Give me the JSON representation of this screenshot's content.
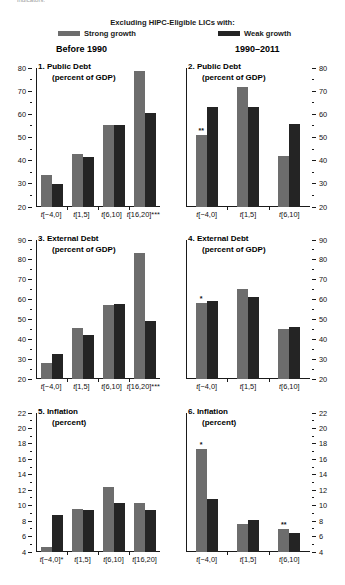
{
  "page": {
    "cut_text": "indicators."
  },
  "legend": {
    "title": "Excluding HIPC-Eligible LICs with:",
    "items": [
      {
        "label": "Strong growth",
        "color": "#6d6d6d",
        "swatch": "gray"
      },
      {
        "label": "Weak growth",
        "color": "#242424",
        "swatch": "dark"
      }
    ]
  },
  "columns": [
    {
      "label": "Before 1990"
    },
    {
      "label": "1990–2011"
    }
  ],
  "chart_data": [
    {
      "type": "bar",
      "panel": "1",
      "title": "1. Public Debt",
      "subtitle": "(percent of GDP)",
      "ylabel": "",
      "ylim": [
        20,
        80
      ],
      "yticks": [
        20,
        30,
        40,
        50,
        60,
        70,
        80
      ],
      "yticklabels": [
        "20",
        "30",
        "40",
        "50",
        "60",
        "70",
        "80"
      ],
      "axis_side": "left",
      "categories": [
        "t[−4,0]",
        "t[1,5]",
        "t[6,10]",
        "t[16,20]***"
      ],
      "series": [
        {
          "name": "Strong growth",
          "color": "#6d6d6d",
          "values": [
            34.0,
            43.0,
            55.5,
            78.5
          ]
        },
        {
          "name": "Weak growth",
          "color": "#242424",
          "values": [
            30.0,
            41.5,
            55.5,
            60.5
          ]
        }
      ],
      "annotations": []
    },
    {
      "type": "bar",
      "panel": "2",
      "title": "2. Public Debt",
      "subtitle": "(percent of GDP)",
      "ylabel": "",
      "ylim": [
        20,
        80
      ],
      "yticks": [
        20,
        30,
        40,
        50,
        60,
        70,
        80
      ],
      "yticklabels": [
        "20",
        "30",
        "40",
        "50",
        "60",
        "70",
        "80"
      ],
      "axis_side": "right",
      "categories": [
        "t[−4,0]",
        "t[1,5]",
        "t[6,10]"
      ],
      "series": [
        {
          "name": "Strong growth",
          "color": "#6d6d6d",
          "values": [
            51.0,
            72.0,
            42.0
          ]
        },
        {
          "name": "Weak growth",
          "color": "#242424",
          "values": [
            63.0,
            63.0,
            56.0
          ]
        }
      ],
      "annotations": [
        {
          "group": 0,
          "series": 0,
          "text": "**"
        }
      ]
    },
    {
      "type": "bar",
      "panel": "3",
      "title": "3. External Debt",
      "subtitle": "(percent of GDP)",
      "ylabel": "",
      "ylim": [
        20,
        90
      ],
      "yticks": [
        20,
        30,
        40,
        50,
        60,
        70,
        80,
        90
      ],
      "yticklabels": [
        "20",
        "30",
        "40",
        "50",
        "60",
        "70",
        "80",
        "90"
      ],
      "axis_side": "left",
      "categories": [
        "t[−4,0]",
        "t[1,5]",
        "t[6,10]",
        "t[16,20]***"
      ],
      "series": [
        {
          "name": "Strong growth",
          "color": "#6d6d6d",
          "values": [
            28.0,
            45.5,
            57.5,
            83.5
          ]
        },
        {
          "name": "Weak growth",
          "color": "#242424",
          "values": [
            32.5,
            42.0,
            58.0,
            49.0
          ]
        }
      ],
      "annotations": []
    },
    {
      "type": "bar",
      "panel": "4",
      "title": "4. External Debt",
      "subtitle": "(percent of GDP)",
      "ylabel": "",
      "ylim": [
        20,
        90
      ],
      "yticks": [
        20,
        30,
        40,
        50,
        60,
        70,
        80,
        90
      ],
      "yticklabels": [
        "20",
        "30",
        "40",
        "50",
        "60",
        "70",
        "80",
        "90"
      ],
      "axis_side": "right",
      "categories": [
        "t[−4,0]",
        "t[1,5]",
        "t[6,10]"
      ],
      "series": [
        {
          "name": "Strong growth",
          "color": "#6d6d6d",
          "values": [
            58.5,
            65.5,
            45.0
          ]
        },
        {
          "name": "Weak growth",
          "color": "#242424",
          "values": [
            59.5,
            61.5,
            46.0
          ]
        }
      ],
      "annotations": [
        {
          "group": 0,
          "series": 0,
          "text": "*"
        }
      ]
    },
    {
      "type": "bar",
      "panel": "5",
      "title": "5. Inflation",
      "subtitle": "(percent)",
      "ylabel": "",
      "ylim": [
        4,
        22
      ],
      "yticks": [
        4,
        6,
        8,
        10,
        12,
        14,
        16,
        18,
        20,
        22
      ],
      "yticklabels": [
        "4",
        "6",
        "8",
        "10",
        "12",
        "14",
        "16",
        "18",
        "20",
        "22"
      ],
      "axis_side": "left",
      "categories": [
        "t[−4,0]*",
        "t[1,5]",
        "t[6,10]",
        "t[16,20]"
      ],
      "series": [
        {
          "name": "Strong growth",
          "color": "#6d6d6d",
          "values": [
            4.7,
            9.6,
            12.4,
            10.4
          ]
        },
        {
          "name": "Weak growth",
          "color": "#242424",
          "values": [
            8.8,
            9.5,
            10.3,
            9.4
          ]
        }
      ],
      "annotations": []
    },
    {
      "type": "bar",
      "panel": "6",
      "title": "6. Inflation",
      "subtitle": "(percent)",
      "ylabel": "",
      "ylim": [
        4,
        22
      ],
      "yticks": [
        4,
        6,
        8,
        10,
        12,
        14,
        16,
        18,
        20,
        22
      ],
      "yticklabels": [
        "4",
        "6",
        "8",
        "10",
        "12",
        "14",
        "16",
        "18",
        "20",
        "22"
      ],
      "axis_side": "right",
      "categories": [
        "t[−4,0]",
        "t[1,5]",
        "t[6,10]"
      ],
      "series": [
        {
          "name": "Strong growth",
          "color": "#6d6d6d",
          "values": [
            17.4,
            7.6,
            7.0
          ]
        },
        {
          "name": "Weak growth",
          "color": "#242424",
          "values": [
            10.9,
            8.1,
            6.4
          ]
        }
      ],
      "annotations": [
        {
          "group": 0,
          "series": 0,
          "text": "*"
        },
        {
          "group": 2,
          "series": 0,
          "text": "**"
        }
      ]
    }
  ]
}
